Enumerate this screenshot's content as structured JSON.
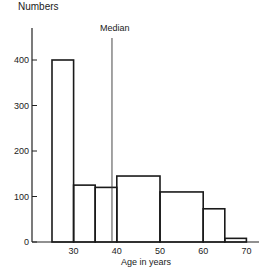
{
  "chart_data": {
    "type": "bar",
    "title": "",
    "xlabel": "Age in years",
    "ylabel": "Numbers",
    "bins": [
      {
        "from": 25,
        "to": 30,
        "value": 400
      },
      {
        "from": 30,
        "to": 35,
        "value": 125
      },
      {
        "from": 35,
        "to": 40,
        "value": 120
      },
      {
        "from": 40,
        "to": 50,
        "value": 145
      },
      {
        "from": 50,
        "to": 60,
        "value": 110
      },
      {
        "from": 60,
        "to": 65,
        "value": 73
      },
      {
        "from": 65,
        "to": 70,
        "value": 8
      }
    ],
    "categories": [
      "25-30",
      "30-35",
      "35-40",
      "40-50",
      "50-60",
      "60-65",
      "65-70"
    ],
    "values": [
      400,
      125,
      120,
      145,
      110,
      73,
      8
    ],
    "xticks": [
      30,
      40,
      50,
      60,
      70
    ],
    "yticks": [
      0,
      100,
      200,
      300,
      400
    ],
    "xlim": [
      20,
      74
    ],
    "ylim": [
      0,
      470
    ],
    "annotations": [
      {
        "type": "vline",
        "x": 39,
        "label": "Median"
      }
    ],
    "grid": false,
    "legend": null
  },
  "labels": {
    "ylabel": "Numbers",
    "xlabel": "Age in years",
    "median": "Median"
  }
}
